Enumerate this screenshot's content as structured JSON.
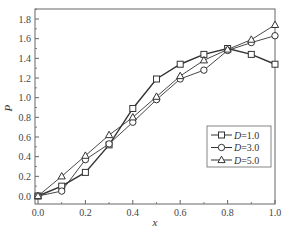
{
  "chart_data": {
    "type": "line",
    "title": "",
    "xlabel": "x",
    "ylabel": "P",
    "xlim": [
      0.0,
      1.0
    ],
    "ylim": [
      -0.05,
      1.9
    ],
    "x_ticks": [
      "0.0",
      "0.2",
      "0.4",
      "0.6",
      "0.8",
      "1.0"
    ],
    "y_ticks": [
      "0.0",
      "0.2",
      "0.4",
      "0.6",
      "0.8",
      "1.0",
      "1.2",
      "1.4",
      "1.6",
      "1.8"
    ],
    "grid": false,
    "legend_position": "lower right (inside)",
    "x": [
      0.0,
      0.1,
      0.2,
      0.3,
      0.4,
      0.5,
      0.6,
      0.7,
      0.8,
      0.9,
      1.0
    ],
    "series": [
      {
        "name": "D=1.0",
        "label_var": "D",
        "label_val": "=1.0",
        "marker": "square",
        "values": [
          0.0,
          0.1,
          0.24,
          0.52,
          0.89,
          1.19,
          1.34,
          1.44,
          1.5,
          1.44,
          1.34
        ]
      },
      {
        "name": "D=3.0",
        "label_var": "D",
        "label_val": "=3.0",
        "marker": "circle",
        "values": [
          0.0,
          0.05,
          0.37,
          0.53,
          0.75,
          0.98,
          1.19,
          1.28,
          1.48,
          1.56,
          1.63
        ]
      },
      {
        "name": "D=5.0",
        "label_var": "D",
        "label_val": "=5.0",
        "marker": "triangle",
        "values": [
          0.0,
          0.2,
          0.41,
          0.62,
          0.8,
          1.01,
          1.22,
          1.38,
          1.49,
          1.59,
          1.74
        ]
      }
    ],
    "colors": {
      "axis": "#555555",
      "line": "#333333",
      "marker_fill": "#ffffff"
    }
  }
}
